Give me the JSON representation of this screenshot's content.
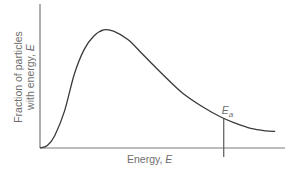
{
  "chart_data": {
    "type": "line",
    "title": "",
    "xlabel": "Energy, ",
    "xlabel_symbol": "E",
    "ylabel_line1": "Fraction of particles",
    "ylabel_line2": "with energy, ",
    "ylabel_symbol": "E",
    "xlim": [
      0,
      1
    ],
    "ylim": [
      0,
      1
    ],
    "grid": false,
    "ticks": false,
    "series": [
      {
        "name": "distribution",
        "x": [
          0.0,
          0.03,
          0.06,
          0.1,
          0.14,
          0.18,
          0.22,
          0.26,
          0.3,
          0.36,
          0.42,
          0.5,
          0.58,
          0.66,
          0.74,
          0.8,
          0.86,
          0.92,
          0.96
        ],
        "y": [
          0.0,
          0.02,
          0.1,
          0.3,
          0.6,
          0.8,
          0.91,
          0.96,
          0.95,
          0.88,
          0.76,
          0.6,
          0.45,
          0.34,
          0.25,
          0.2,
          0.16,
          0.14,
          0.135
        ]
      }
    ],
    "annotations": [
      {
        "label": "E",
        "subscript": "a",
        "x": 0.75,
        "meaning": "activation energy threshold"
      }
    ]
  }
}
